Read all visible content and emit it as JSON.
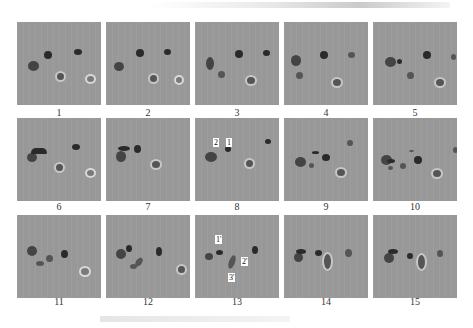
{
  "figure": {
    "panel_labels": [
      "1",
      "2",
      "3",
      "4",
      "5",
      "6",
      "7",
      "8",
      "9",
      "10",
      "11",
      "12",
      "13",
      "14",
      "15"
    ],
    "annotations": {
      "panel_8": [
        "2",
        "1"
      ],
      "panel_13": [
        "1'",
        "2'",
        "3'"
      ]
    },
    "caption": ""
  }
}
